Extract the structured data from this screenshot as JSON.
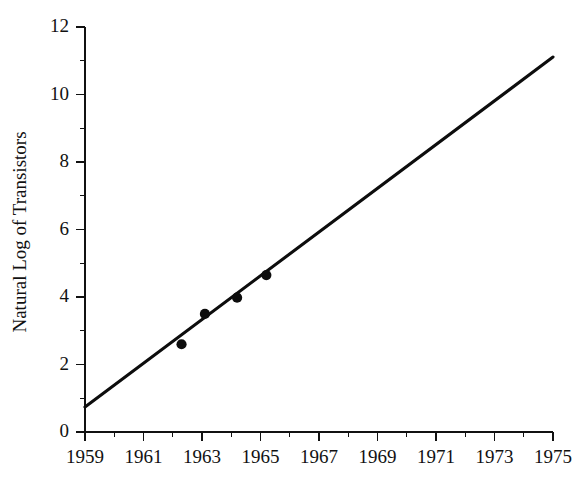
{
  "chart_data": {
    "type": "scatter",
    "title": "",
    "subtitle": "",
    "xlabel": "",
    "ylabel": "Natural Log of Transistors",
    "xlim": [
      1959,
      1975
    ],
    "ylim": [
      0,
      12
    ],
    "grid": false,
    "legend": null,
    "x_major_ticks": [
      1959,
      1961,
      1963,
      1965,
      1967,
      1969,
      1971,
      1973,
      1975
    ],
    "x_minor_ticks": [
      1960,
      1962,
      1964,
      1966,
      1968,
      1970,
      1972,
      1974
    ],
    "x_tick_labels": [
      "1959",
      "1961",
      "1963",
      "1965",
      "1967",
      "1969",
      "1971",
      "1973",
      "1975"
    ],
    "y_major_ticks": [
      0,
      2,
      4,
      6,
      8,
      10,
      12
    ],
    "y_minor_ticks": [
      1,
      3,
      5,
      7,
      9,
      11
    ],
    "y_tick_labels": [
      "0",
      "2",
      "4",
      "6",
      "8",
      "10",
      "12"
    ],
    "series": [
      {
        "name": "Observed transistor counts",
        "type": "scatter",
        "marker": "filled-circle",
        "color": "#0d0d0d",
        "points": [
          {
            "x": 1962.3,
            "y": 2.6
          },
          {
            "x": 1963.1,
            "y": 3.5
          },
          {
            "x": 1964.2,
            "y": 3.98
          },
          {
            "x": 1965.2,
            "y": 4.65
          }
        ]
      },
      {
        "name": "Fitted trend line",
        "type": "line",
        "color": "#0d0d0d",
        "points": [
          {
            "x": 1959,
            "y": 0.74
          },
          {
            "x": 1975,
            "y": 11.11
          }
        ]
      }
    ],
    "annotations": []
  },
  "colors": {
    "background": "#ffffff",
    "ink": "#111111",
    "line": "#0d0d0d",
    "marker": "#0d0d0d"
  }
}
